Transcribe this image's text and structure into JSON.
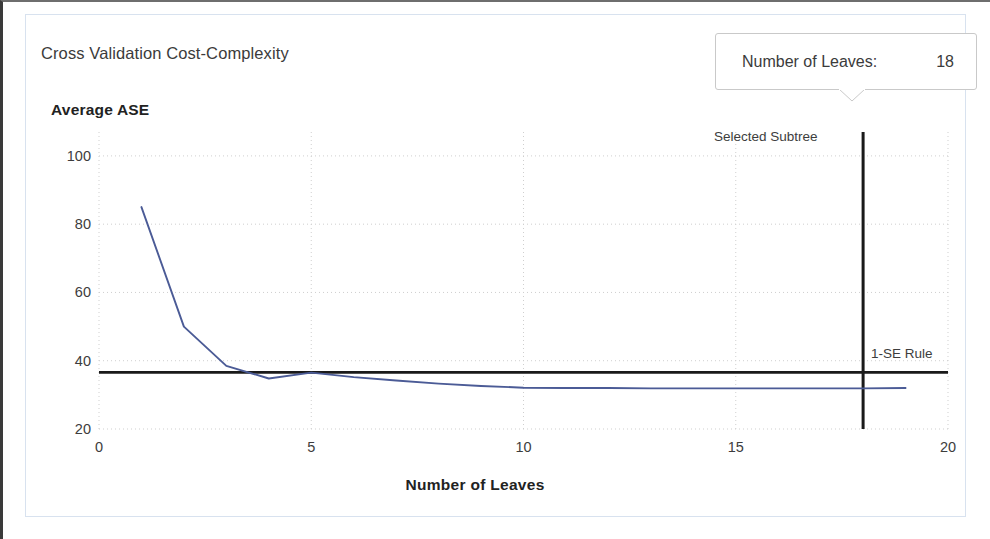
{
  "chart_data": {
    "type": "line",
    "title": "Cross Validation Cost-Complexity",
    "xlabel": "Number of Leaves",
    "ylabel": "Average ASE",
    "xlim": [
      0,
      20
    ],
    "ylim": [
      20,
      107
    ],
    "grid": true,
    "legend": "none",
    "xticks": [
      0,
      5,
      10,
      15,
      20
    ],
    "yticks": [
      20,
      40,
      60,
      80,
      100
    ],
    "series": [
      {
        "name": "Average ASE",
        "color": "#4b5b96",
        "x": [
          1,
          2,
          3,
          4,
          5,
          6,
          7,
          8,
          9,
          10,
          11,
          12,
          13,
          14,
          15,
          16,
          17,
          18,
          19
        ],
        "values": [
          85.0,
          50.0,
          38.5,
          34.8,
          36.5,
          35.2,
          34.2,
          33.3,
          32.6,
          32.1,
          32.0,
          32.0,
          31.9,
          31.9,
          31.9,
          31.9,
          31.9,
          31.9,
          32.0
        ]
      }
    ],
    "reference_lines": [
      {
        "name": "1-SE Rule",
        "orientation": "horizontal",
        "value": 36.6,
        "label": "1-SE Rule",
        "color": "#1a1a1a",
        "x_start": 0,
        "x_end": 20
      },
      {
        "name": "Selected Subtree",
        "orientation": "vertical",
        "value": 18,
        "label": "Selected Subtree",
        "color": "#1a1a1a",
        "y_start": 20,
        "y_end": 107
      }
    ]
  },
  "tooltip": {
    "label": "Number of Leaves:",
    "value": "18"
  },
  "annotations": {
    "selected_subtree": "Selected Subtree",
    "one_se_rule": "1-SE Rule"
  },
  "colors": {
    "series_line": "#4b5b96",
    "reference_line": "#1a1a1a",
    "gridline": "#cfcfcf",
    "panel_border": "#d8e2ef",
    "text": "#3b3b3b"
  }
}
